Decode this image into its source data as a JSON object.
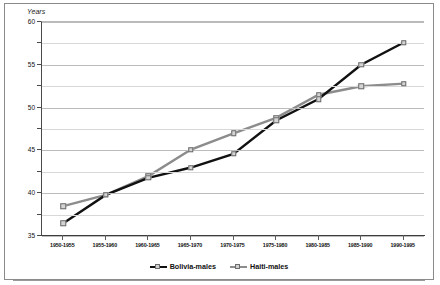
{
  "chart_data": {
    "type": "line",
    "title": "",
    "ylabel": "Years",
    "xlabel": "",
    "ylim": [
      35,
      60
    ],
    "grid": true,
    "legend_position": "bottom",
    "categories": [
      "1950-1955",
      "1955-1960",
      "1960-1965",
      "1965-1970",
      "1970-1975",
      "1975-1980",
      "1980-1985",
      "1985-1990",
      "1990-1995"
    ],
    "yticks": [
      "60",
      "55",
      "50",
      "45",
      "40",
      "35"
    ],
    "ytick_values": [
      60,
      55,
      50,
      45,
      40,
      35
    ],
    "minor_tick_step": 2.5,
    "series": [
      {
        "name": "Bolivia-males",
        "color": "#111111",
        "values": [
          36.5,
          39.8,
          41.8,
          43.0,
          44.6,
          48.5,
          51.0,
          55.0,
          57.6
        ]
      },
      {
        "name": "Haiti-males",
        "color": "#8c8c8c",
        "values": [
          38.5,
          39.8,
          42.0,
          45.1,
          47.0,
          48.8,
          51.5,
          52.5,
          52.8
        ]
      }
    ]
  },
  "axis": {
    "y_title": "Years"
  },
  "legend": {
    "items": [
      {
        "label": "Bolivia-males"
      },
      {
        "label": "Haiti-males"
      }
    ]
  }
}
